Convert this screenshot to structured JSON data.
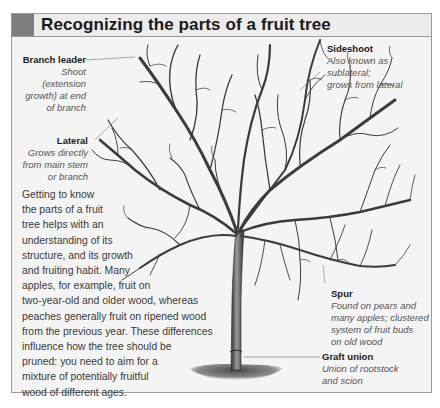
{
  "title": "Recognizing the parts of a fruit tree",
  "colors": {
    "panel_bg": "#f4f4f4",
    "header_bg": "#ececec",
    "header_block": "#7d7d7d",
    "border": "#9a9a9a",
    "branch": "#3b3b3b"
  },
  "labels": {
    "branch_leader": {
      "name": "Branch leader",
      "desc": [
        "Shoot (extension",
        "growth) at end",
        "of branch"
      ]
    },
    "lateral": {
      "name": "Lateral",
      "desc": [
        "Grows directly",
        "from main stem",
        "or branch"
      ]
    },
    "sideshoot": {
      "name": "Sideshoot",
      "desc": [
        "Also known as sublateral;",
        "grows from lateral"
      ]
    },
    "spur": {
      "name": "Spur",
      "desc": [
        "Found on pears and",
        "many apples; clustered",
        "system of fruit buds",
        "on old wood"
      ]
    },
    "graft_union": {
      "name": "Graft union",
      "desc": [
        "Union of rootstock",
        "and scion"
      ]
    }
  },
  "intro_lines": [
    "Getting to know",
    "the parts of a fruit",
    "tree helps with an",
    "understanding of its",
    "structure, and its growth",
    "and fruiting habit. Many",
    "apples, for example, fruit on",
    "two-year-old and older wood, whereas",
    "peaches generally fruit on ripened wood",
    "from the previous year. These differences",
    "influence how the tree should be",
    "pruned: you need to aim for a",
    "mixture of potentially fruitful",
    "wood of different ages."
  ]
}
